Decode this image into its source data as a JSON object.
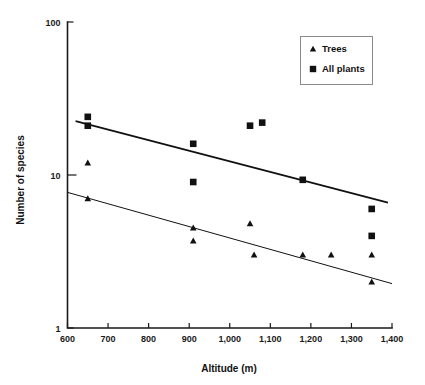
{
  "chart_data": {
    "type": "scatter",
    "title": "",
    "subtitle": "",
    "xlabel": "Altitude (m)",
    "ylabel": "Number of species",
    "xlim": [
      600,
      1400
    ],
    "ylim": [
      1,
      100
    ],
    "yscale": "log",
    "xscale": "linear",
    "grid": false,
    "legend_position": "top-right",
    "x_ticks": [
      600,
      700,
      800,
      900,
      1000,
      1100,
      1200,
      1300,
      1400
    ],
    "x_tick_labels": [
      "600",
      "700",
      "800",
      "900",
      "1,000",
      "1,100",
      "1,200",
      "1,300",
      "1,400"
    ],
    "y_ticks": [
      1,
      10,
      100
    ],
    "y_tick_labels": [
      "1",
      "10",
      "100"
    ],
    "series": [
      {
        "name": "Trees",
        "marker": "triangle",
        "color": "#111111",
        "points": [
          {
            "x": 650,
            "y": 12
          },
          {
            "x": 650,
            "y": 7
          },
          {
            "x": 910,
            "y": 4.5
          },
          {
            "x": 910,
            "y": 3.7
          },
          {
            "x": 1050,
            "y": 4.8
          },
          {
            "x": 1060,
            "y": 3.0
          },
          {
            "x": 1180,
            "y": 3.0
          },
          {
            "x": 1250,
            "y": 3.0
          },
          {
            "x": 1350,
            "y": 3.0
          },
          {
            "x": 1350,
            "y": 2.0
          }
        ],
        "trendline": {
          "x1": 600,
          "y1": 7.7,
          "x2": 1400,
          "y2": 1.95
        }
      },
      {
        "name": "All plants",
        "marker": "square",
        "color": "#111111",
        "points": [
          {
            "x": 650,
            "y": 24
          },
          {
            "x": 650,
            "y": 21
          },
          {
            "x": 910,
            "y": 16
          },
          {
            "x": 910,
            "y": 9.0
          },
          {
            "x": 1050,
            "y": 21
          },
          {
            "x": 1080,
            "y": 22
          },
          {
            "x": 1180,
            "y": 9.3
          },
          {
            "x": 1350,
            "y": 6.0
          },
          {
            "x": 1350,
            "y": 4.0
          }
        ],
        "trendline": {
          "x1": 620,
          "y1": 22.5,
          "x2": 1390,
          "y2": 6.6
        }
      }
    ],
    "legend_entries": [
      {
        "label": "Trees",
        "marker": "triangle"
      },
      {
        "label": "All plants",
        "marker": "square"
      }
    ]
  }
}
